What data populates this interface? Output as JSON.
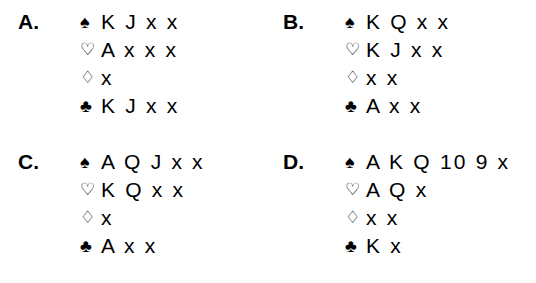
{
  "document": {
    "type": "bridge-hand-diagram",
    "background_color": "#ffffff",
    "text_color": "#000000",
    "suit_symbols": {
      "spade": "♠",
      "heart": "♡",
      "diamond": "♢",
      "club": "♣"
    }
  },
  "hands": [
    {
      "label": "A.",
      "suits": [
        {
          "suit": "spade",
          "symbol": "♠",
          "filled": true,
          "cards": "K J x x"
        },
        {
          "suit": "heart",
          "symbol": "♡",
          "filled": false,
          "cards": "A x x x"
        },
        {
          "suit": "diamond",
          "symbol": "♢",
          "filled": false,
          "cards": "x"
        },
        {
          "suit": "club",
          "symbol": "♣",
          "filled": true,
          "cards": "K J x x"
        }
      ]
    },
    {
      "label": "B.",
      "suits": [
        {
          "suit": "spade",
          "symbol": "♠",
          "filled": true,
          "cards": "K Q x x"
        },
        {
          "suit": "heart",
          "symbol": "♡",
          "filled": false,
          "cards": "K J x x"
        },
        {
          "suit": "diamond",
          "symbol": "♢",
          "filled": false,
          "cards": "x x"
        },
        {
          "suit": "club",
          "symbol": "♣",
          "filled": true,
          "cards": "A x x"
        }
      ]
    },
    {
      "label": "C.",
      "suits": [
        {
          "suit": "spade",
          "symbol": "♠",
          "filled": true,
          "cards": "A Q J x x"
        },
        {
          "suit": "heart",
          "symbol": "♡",
          "filled": false,
          "cards": "K Q x x"
        },
        {
          "suit": "diamond",
          "symbol": "♢",
          "filled": false,
          "cards": "x"
        },
        {
          "suit": "club",
          "symbol": "♣",
          "filled": true,
          "cards": "A x x"
        }
      ]
    },
    {
      "label": "D.",
      "suits": [
        {
          "suit": "spade",
          "symbol": "♠",
          "filled": true,
          "cards": "A K Q 10 9 x"
        },
        {
          "suit": "heart",
          "symbol": "♡",
          "filled": false,
          "cards": "A Q x"
        },
        {
          "suit": "diamond",
          "symbol": "♢",
          "filled": false,
          "cards": "x x"
        },
        {
          "suit": "club",
          "symbol": "♣",
          "filled": true,
          "cards": "K x"
        }
      ]
    }
  ]
}
